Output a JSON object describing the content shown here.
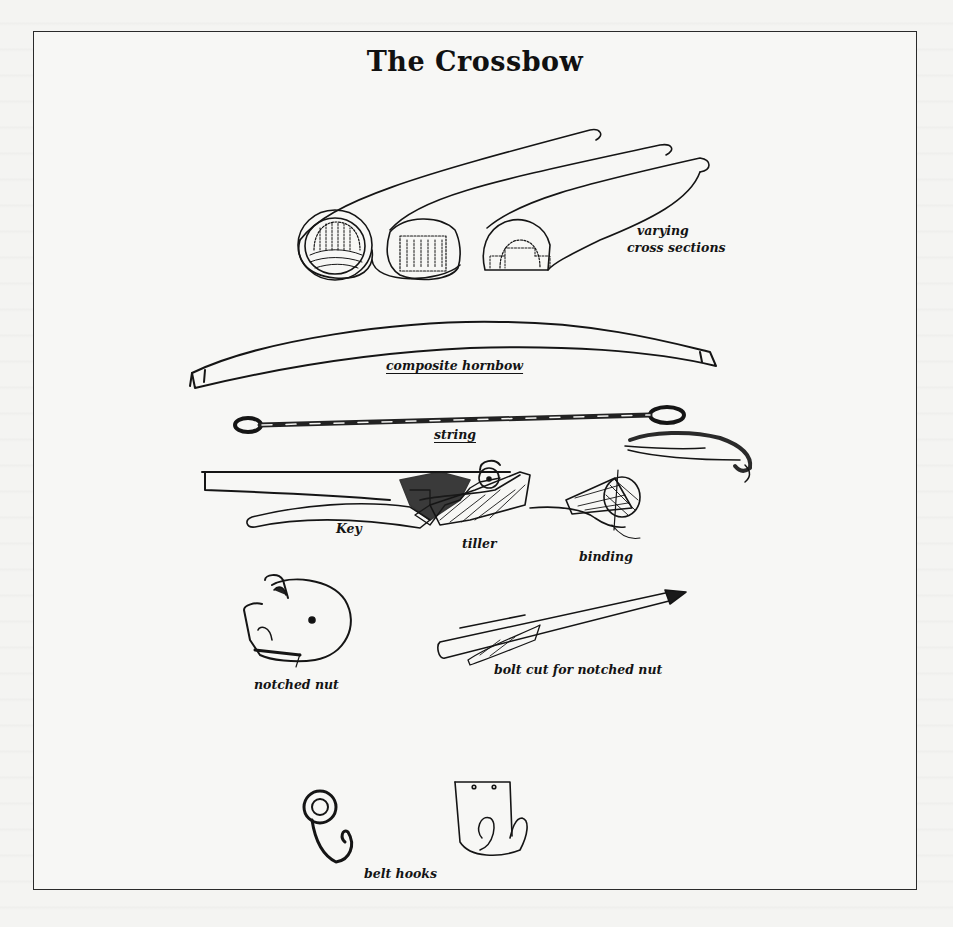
{
  "page": {
    "title": "The Crossbow",
    "background_color": "#f4f4f2",
    "ink_color": "#141414"
  },
  "illustration": {
    "items": [
      {
        "id": "cross-sections",
        "label": "varying cross sections",
        "label_lines": [
          "varying",
          "cross sections"
        ],
        "underlined": false
      },
      {
        "id": "hornbow",
        "label": "composite hornbow",
        "underlined": true
      },
      {
        "id": "string",
        "label": "string",
        "underlined": true
      },
      {
        "id": "key",
        "label": "Key",
        "underlined": false
      },
      {
        "id": "tiller",
        "label": "tiller",
        "underlined": false
      },
      {
        "id": "binding",
        "label": "binding",
        "underlined": false
      },
      {
        "id": "notched-nut",
        "label": "notched nut",
        "underlined": false
      },
      {
        "id": "bolt",
        "label": "bolt cut for notched nut",
        "underlined": false
      },
      {
        "id": "belt-hooks",
        "label": "belt hooks",
        "underlined": false
      }
    ]
  }
}
